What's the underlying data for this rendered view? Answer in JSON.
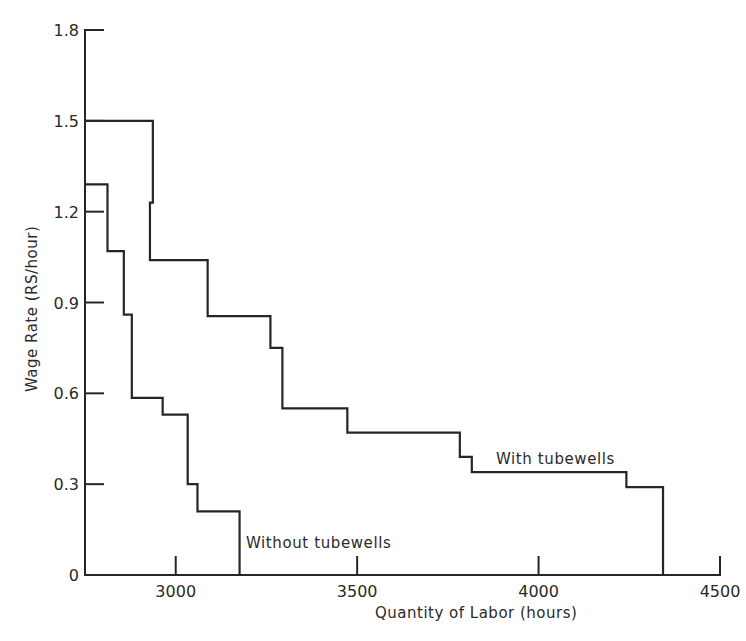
{
  "chart_data": {
    "type": "line",
    "subtype": "step",
    "title": "",
    "xlabel": "Quantity of Labor (hours)",
    "ylabel": "Wage Rate (RS/hour)",
    "xlim": [
      2750,
      4500
    ],
    "ylim": [
      0,
      1.8
    ],
    "x_ticks": [
      3000,
      3500,
      4000,
      4500
    ],
    "x_tick_labels": [
      "3000",
      "3500",
      "4000",
      "4500"
    ],
    "y_ticks": [
      0,
      0.3,
      0.6,
      0.9,
      1.2,
      1.5,
      1.8
    ],
    "y_tick_labels": [
      "0",
      "0.3",
      "0.6",
      "0.9",
      "1.2",
      "1.5",
      "1.8"
    ],
    "grid": false,
    "legend": "none (series labelled by inline annotations)",
    "series": [
      {
        "name": "With tubewells",
        "annotation": "With tubewells",
        "steps": [
          {
            "x_from": 2750,
            "x_to": 2937,
            "y": 1.5
          },
          {
            "x_from": 2937,
            "x_to": 2929,
            "y": 1.23
          },
          {
            "x_from": 2929,
            "x_to": 3088,
            "y": 1.04
          },
          {
            "x_from": 3088,
            "x_to": 3261,
            "y": 0.855
          },
          {
            "x_from": 3261,
            "x_to": 3294,
            "y": 0.75
          },
          {
            "x_from": 3294,
            "x_to": 3473,
            "y": 0.55
          },
          {
            "x_from": 3473,
            "x_to": 3783,
            "y": 0.47
          },
          {
            "x_from": 3783,
            "x_to": 3816,
            "y": 0.39
          },
          {
            "x_from": 3816,
            "x_to": 4242,
            "y": 0.34
          },
          {
            "x_from": 4242,
            "x_to": 4343,
            "y": 0.29
          }
        ],
        "end_x": 4343
      },
      {
        "name": "Without tubewells",
        "annotation": "Without tubewells",
        "steps": [
          {
            "x_from": 2750,
            "x_to": 2812,
            "y": 1.29
          },
          {
            "x_from": 2812,
            "x_to": 2857,
            "y": 1.07
          },
          {
            "x_from": 2857,
            "x_to": 2879,
            "y": 0.86
          },
          {
            "x_from": 2879,
            "x_to": 2964,
            "y": 0.585
          },
          {
            "x_from": 2964,
            "x_to": 3033,
            "y": 0.53
          },
          {
            "x_from": 3033,
            "x_to": 3060,
            "y": 0.3
          },
          {
            "x_from": 3060,
            "x_to": 3176,
            "y": 0.21
          }
        ],
        "end_x": 3176
      }
    ],
    "annotations": [
      {
        "text": "With tubewells",
        "x": 3920,
        "y": 0.38
      },
      {
        "text": "Without tubewells",
        "x": 3350,
        "y": 0.13
      }
    ]
  },
  "labels": {
    "xlabel": "Quantity of Labor (hours)",
    "ylabel": "Wage Rate  (RS/hour)",
    "with_tubewells": "With tubewells",
    "without_tubewells": "Without tubewells"
  }
}
